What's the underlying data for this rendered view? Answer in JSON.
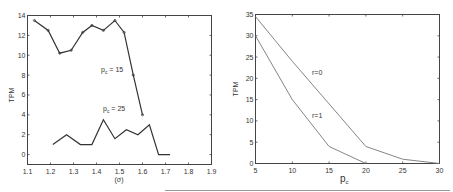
{
  "chart_data": [
    {
      "type": "line",
      "title": "",
      "xlabel": "(σ)",
      "ylabel": "TPM",
      "xlim": [
        1.1,
        1.9
      ],
      "ylim": [
        -1,
        14
      ],
      "xticks": [
        "1.1",
        "1.2",
        "1.3",
        "1.4",
        "1.5",
        "1.6",
        "1.7",
        "1.8",
        "1.9"
      ],
      "yticks": [
        "0",
        "2",
        "4",
        "6",
        "8",
        "10",
        "12",
        "14"
      ],
      "grid": false,
      "series": [
        {
          "name": "p_c = 15",
          "label_main": "p",
          "label_sub": "c",
          "label_rest": " = 15",
          "markers": true,
          "x": [
            1.13,
            1.19,
            1.24,
            1.29,
            1.34,
            1.38,
            1.43,
            1.48,
            1.52,
            1.56,
            1.6
          ],
          "y": [
            13.5,
            12.5,
            10.2,
            10.5,
            12.3,
            13.0,
            12.5,
            13.5,
            12.3,
            8.0,
            4.0
          ]
        },
        {
          "name": "p_c = 25",
          "label_main": "p",
          "label_sub": "c",
          "label_rest": " = 25",
          "markers": false,
          "x": [
            1.21,
            1.27,
            1.33,
            1.38,
            1.43,
            1.48,
            1.53,
            1.58,
            1.63,
            1.67,
            1.72
          ],
          "y": [
            1.0,
            2.0,
            1.0,
            1.0,
            3.5,
            1.6,
            2.5,
            2.0,
            3.0,
            0.0,
            0.0
          ]
        }
      ]
    },
    {
      "type": "line",
      "title": "",
      "xlabel_main": "p",
      "xlabel_sub": "c",
      "ylabel": "TPM",
      "xlim": [
        5,
        30
      ],
      "ylim": [
        0,
        35
      ],
      "xticks": [
        "5",
        "10",
        "15",
        "20",
        "25",
        "30"
      ],
      "yticks": [
        "0",
        "5",
        "10",
        "15",
        "20",
        "25",
        "30",
        "35"
      ],
      "grid": false,
      "series": [
        {
          "name": "r=0",
          "x": [
            5,
            10,
            15,
            20,
            25,
            30
          ],
          "y": [
            34.5,
            24,
            14,
            4,
            1,
            0
          ]
        },
        {
          "name": "r=1",
          "x": [
            5,
            10,
            15,
            20
          ],
          "y": [
            30,
            15,
            4,
            0
          ]
        }
      ]
    }
  ]
}
